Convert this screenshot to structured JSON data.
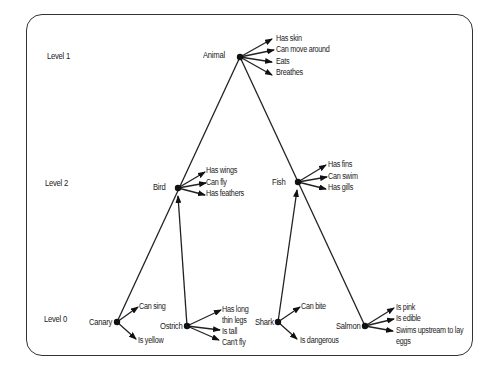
{
  "levels": [
    "Level 1",
    "Level 2",
    "Level 0"
  ],
  "nodes": {
    "animal": {
      "label": "Animal",
      "properties": [
        "Has skin",
        "Can move around",
        "Eats",
        "Breathes"
      ]
    },
    "bird": {
      "label": "Bird",
      "properties": [
        "Has wings",
        "Can fly",
        "Has feathers"
      ]
    },
    "fish": {
      "label": "Fish",
      "properties": [
        "Has fins",
        "Can swim",
        "Has gills"
      ]
    },
    "canary": {
      "label": "Canary",
      "properties": [
        "Can sing",
        "Is yellow"
      ]
    },
    "ostrich": {
      "label": "Ostrich",
      "properties": [
        "Has long thin legs",
        "Is tall",
        "Can't fly"
      ]
    },
    "shark": {
      "label": "Shark",
      "properties": [
        "Can bite",
        "Is dangerous"
      ]
    },
    "salmon": {
      "label": "Salmon",
      "properties": [
        "Is pink",
        "Is edible",
        "Swims upstream to lay eggs"
      ]
    }
  },
  "ostrich_prop_lines": [
    "Has long",
    "thin legs"
  ],
  "salmon_prop_lines": [
    "Swims upstream to lay",
    "eggs"
  ],
  "edges": [
    {
      "from": "canary",
      "to": "bird",
      "type": "is-a"
    },
    {
      "from": "ostrich",
      "to": "bird",
      "type": "is-a"
    },
    {
      "from": "shark",
      "to": "fish",
      "type": "is-a"
    },
    {
      "from": "salmon",
      "to": "fish",
      "type": "is-a"
    },
    {
      "from": "bird",
      "to": "animal",
      "type": "is-a"
    },
    {
      "from": "fish",
      "to": "animal",
      "type": "is-a"
    }
  ]
}
